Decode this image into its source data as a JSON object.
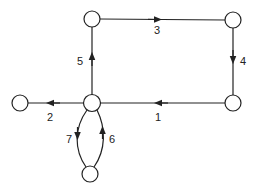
{
  "diagram": {
    "type": "directed-graph",
    "stroke_color": "#222222",
    "background": "#ffffff",
    "nodes": [
      {
        "id": "A",
        "x": 92,
        "y": 19
      },
      {
        "id": "B",
        "x": 233,
        "y": 20
      },
      {
        "id": "C",
        "x": 233,
        "y": 103
      },
      {
        "id": "D",
        "x": 92,
        "y": 103
      },
      {
        "id": "E",
        "x": 20,
        "y": 103
      },
      {
        "id": "F",
        "x": 90,
        "y": 174
      }
    ],
    "edges": [
      {
        "label": "1",
        "from": "C",
        "to": "D"
      },
      {
        "label": "2",
        "from": "D",
        "to": "E"
      },
      {
        "label": "3",
        "from": "A",
        "to": "B"
      },
      {
        "label": "4",
        "from": "B",
        "to": "C"
      },
      {
        "label": "5",
        "from": "D",
        "to": "A"
      },
      {
        "label": "6",
        "from": "F",
        "to": "D"
      },
      {
        "label": "7",
        "from": "D",
        "to": "F"
      }
    ],
    "labels": {
      "e1": "1",
      "e2": "2",
      "e3": "3",
      "e4": "4",
      "e5": "5",
      "e6": "6",
      "e7": "7"
    }
  }
}
